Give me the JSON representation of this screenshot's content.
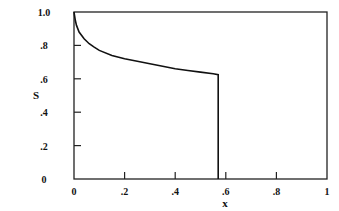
{
  "chart_data": {
    "type": "line",
    "title": "",
    "xlabel": "x",
    "ylabel": "S",
    "xlim": [
      0,
      1
    ],
    "ylim": [
      0,
      1.0
    ],
    "grid": false,
    "legend": null,
    "x_ticks": [
      "0",
      ".2",
      ".4",
      ".6",
      ".8",
      "1"
    ],
    "y_ticks": [
      "0",
      ".2",
      ".4",
      ".6",
      ".8",
      "1.0"
    ],
    "series": [
      {
        "name": "S",
        "x": [
          0,
          0.005,
          0.01,
          0.02,
          0.04,
          0.06,
          0.08,
          0.1,
          0.15,
          0.2,
          0.25,
          0.3,
          0.35,
          0.4,
          0.45,
          0.5,
          0.55,
          0.57,
          0.57
        ],
        "y": [
          1.0,
          0.95,
          0.92,
          0.88,
          0.84,
          0.81,
          0.79,
          0.77,
          0.74,
          0.72,
          0.705,
          0.69,
          0.675,
          0.66,
          0.65,
          0.64,
          0.63,
          0.625,
          0.0
        ]
      }
    ]
  }
}
